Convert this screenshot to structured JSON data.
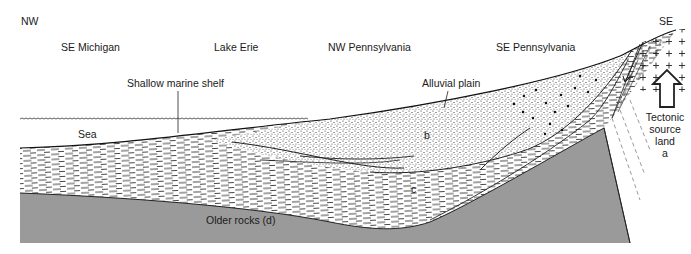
{
  "diagram": {
    "orientation": {
      "left": "NW",
      "right": "SE"
    },
    "regions": [
      "SE Michigan",
      "Lake Erie",
      "NW Pennsylvania",
      "SE Pennsylvania"
    ],
    "environments": {
      "shelf": "Shallow marine shelf",
      "plain": "Alluvial plain",
      "sea": "Sea"
    },
    "units": {
      "b": "b",
      "c": "c",
      "d": "Older rocks (d)"
    },
    "source": {
      "line1": "Tectonic",
      "line2": "source",
      "line3": "land",
      "line4": "a"
    },
    "colors": {
      "basement": "#9a9a9a",
      "ink": "#1a1a1a",
      "background": "#ffffff"
    }
  }
}
